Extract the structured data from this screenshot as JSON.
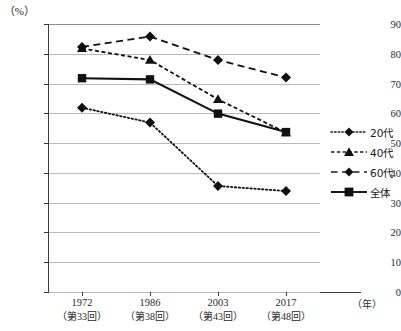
{
  "chart_data": {
    "type": "line",
    "title": "",
    "xlabel": "（年）",
    "ylabel": "（%）",
    "ylim": [
      0,
      90
    ],
    "ytick_step": 10,
    "grid": true,
    "legend_position": "right",
    "categories": [
      "1972",
      "1986",
      "2003",
      "2017"
    ],
    "category_sublabels": [
      "（第33回）",
      "（第38回）",
      "（第43回）",
      "（第48回）"
    ],
    "yticks": [
      "0",
      "10",
      "20",
      "30",
      "40",
      "50",
      "60",
      "70",
      "80",
      "90"
    ],
    "series": [
      {
        "name": "20代",
        "marker": "diamond",
        "line": "dotted",
        "values": [
          61.9,
          56.9,
          35.6,
          33.9
        ]
      },
      {
        "name": "40代",
        "marker": "triangle",
        "line": "dashed",
        "values": [
          81.8,
          77.9,
          64.7,
          53.5
        ]
      },
      {
        "name": "60代",
        "marker": "diamond",
        "line": "long-dashed",
        "values": [
          82.3,
          85.8,
          77.9,
          72.0
        ]
      },
      {
        "name": "全体",
        "marker": "square",
        "line": "solid",
        "values": [
          71.8,
          71.4,
          59.9,
          53.7
        ]
      }
    ]
  },
  "axis": {
    "unit_top": "（%）",
    "unit_right": "（年）"
  },
  "legend": {
    "items": [
      {
        "label": "20代"
      },
      {
        "label": "40代"
      },
      {
        "label": "60代"
      },
      {
        "label": "全体"
      }
    ]
  },
  "colors": {
    "ink": "#1a1a1a",
    "grid": "#b9b9b9",
    "axis": "#3a3a3a"
  }
}
